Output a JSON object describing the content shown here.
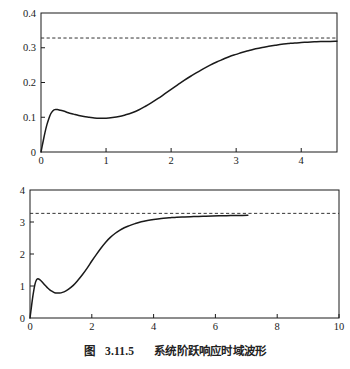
{
  "figure": {
    "caption_label": "图",
    "caption_number": "3.11.5",
    "caption_title": "系统阶跃响应时域波形",
    "caption_full": "图 3.11.5  系统阶跃响应时域波形",
    "background_color": "#ffffff",
    "line_color": "#1a1a1a",
    "dashed_color": "#333333"
  },
  "chart_data": [
    {
      "type": "line",
      "id": "top-chart",
      "title": "",
      "subtitle": "",
      "xlabel": "",
      "ylabel": "",
      "xlim": [
        0,
        4.55
      ],
      "ylim": [
        0,
        0.4
      ],
      "xticks": [
        0,
        1,
        2,
        3,
        4
      ],
      "xticklabels": [
        "0",
        "1",
        "2",
        "3",
        "4"
      ],
      "yticks": [
        0,
        0.1,
        0.2,
        0.3,
        0.4
      ],
      "yticklabels": [
        "0",
        "0.1",
        "0.2",
        "0.3",
        "0.4"
      ],
      "grid": false,
      "legend": "none",
      "annotations": [
        {
          "kind": "horizontal-reference-line",
          "style": "dashed",
          "y": 0.328,
          "label": ""
        }
      ],
      "series": [
        {
          "name": "step response",
          "style": "solid",
          "x": [
            0.0,
            0.03,
            0.06,
            0.09,
            0.12,
            0.15,
            0.18,
            0.21,
            0.25,
            0.3,
            0.36,
            0.42,
            0.5,
            0.58,
            0.66,
            0.74,
            0.82,
            0.9,
            1.0,
            1.1,
            1.2,
            1.3,
            1.4,
            1.5,
            1.6,
            1.7,
            1.8,
            1.9,
            2.0,
            2.1,
            2.2,
            2.3,
            2.4,
            2.5,
            2.6,
            2.7,
            2.8,
            2.9,
            3.0,
            3.1,
            3.2,
            3.3,
            3.4,
            3.5,
            3.6,
            3.7,
            3.8,
            3.9,
            4.0,
            4.1,
            4.2,
            4.3,
            4.4,
            4.55
          ],
          "y": [
            0.0,
            0.028,
            0.055,
            0.078,
            0.096,
            0.11,
            0.118,
            0.122,
            0.122,
            0.12,
            0.117,
            0.113,
            0.109,
            0.105,
            0.102,
            0.1,
            0.098,
            0.097,
            0.097,
            0.099,
            0.102,
            0.107,
            0.113,
            0.121,
            0.131,
            0.142,
            0.154,
            0.167,
            0.18,
            0.193,
            0.206,
            0.218,
            0.229,
            0.24,
            0.25,
            0.259,
            0.267,
            0.275,
            0.281,
            0.287,
            0.292,
            0.297,
            0.301,
            0.304,
            0.307,
            0.31,
            0.312,
            0.314,
            0.315,
            0.316,
            0.317,
            0.318,
            0.318,
            0.319
          ]
        }
      ]
    },
    {
      "type": "line",
      "id": "bottom-chart",
      "title": "",
      "subtitle": "",
      "xlabel": "",
      "ylabel": "",
      "xlim": [
        0,
        10
      ],
      "ylim": [
        0,
        4
      ],
      "xticks": [
        0,
        2,
        4,
        6,
        8,
        10
      ],
      "xticklabels": [
        "0",
        "2",
        "4",
        "6",
        "8",
        "10"
      ],
      "yticks": [
        0,
        1,
        2,
        3,
        4
      ],
      "yticklabels": [
        "0",
        "1",
        "2",
        "3",
        "4"
      ],
      "grid": false,
      "legend": "none",
      "annotations": [
        {
          "kind": "horizontal-reference-line",
          "style": "dashed",
          "y": 3.27,
          "label": ""
        }
      ],
      "series": [
        {
          "name": "step response",
          "style": "solid",
          "x": [
            0.0,
            0.04,
            0.08,
            0.12,
            0.16,
            0.2,
            0.24,
            0.28,
            0.34,
            0.4,
            0.48,
            0.56,
            0.64,
            0.72,
            0.8,
            0.88,
            0.96,
            1.05,
            1.15,
            1.25,
            1.4,
            1.55,
            1.7,
            1.85,
            2.0,
            2.15,
            2.3,
            2.45,
            2.6,
            2.75,
            2.9,
            3.05,
            3.2,
            3.4,
            3.6,
            3.8,
            4.0,
            4.25,
            4.5,
            4.75,
            5.0,
            5.3,
            5.6,
            5.9,
            6.2,
            6.5,
            6.8,
            7.05
          ],
          "y": [
            0.0,
            0.3,
            0.6,
            0.85,
            1.05,
            1.17,
            1.22,
            1.22,
            1.18,
            1.12,
            1.03,
            0.95,
            0.88,
            0.83,
            0.79,
            0.78,
            0.78,
            0.8,
            0.84,
            0.9,
            1.02,
            1.18,
            1.36,
            1.56,
            1.78,
            1.99,
            2.19,
            2.37,
            2.52,
            2.64,
            2.74,
            2.82,
            2.88,
            2.95,
            3.01,
            3.05,
            3.08,
            3.11,
            3.13,
            3.15,
            3.16,
            3.17,
            3.18,
            3.19,
            3.195,
            3.2,
            3.205,
            3.21
          ]
        }
      ]
    }
  ]
}
